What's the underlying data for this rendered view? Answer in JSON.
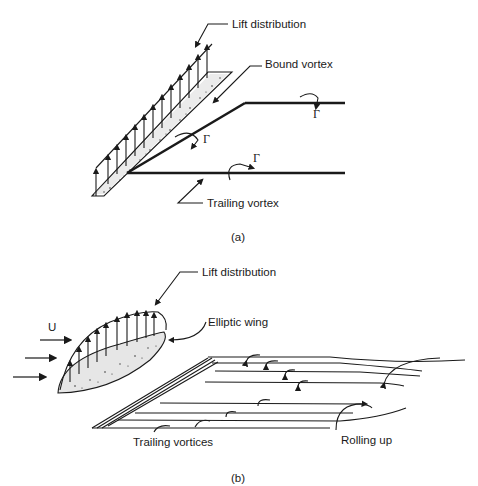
{
  "figure_a": {
    "caption": "(a)",
    "labels": {
      "lift_distribution": "Lift distribution",
      "bound_vortex": "Bound vortex",
      "trailing_vortex": "Trailing vortex",
      "circulation_symbol": "Γ"
    }
  },
  "figure_b": {
    "caption": "(b)",
    "labels": {
      "lift_distribution": "Lift distribution",
      "elliptic_wing": "Elliptic wing",
      "freestream": "U",
      "trailing_vortices": "Trailing vortices",
      "rolling_up": "Rolling up"
    }
  }
}
